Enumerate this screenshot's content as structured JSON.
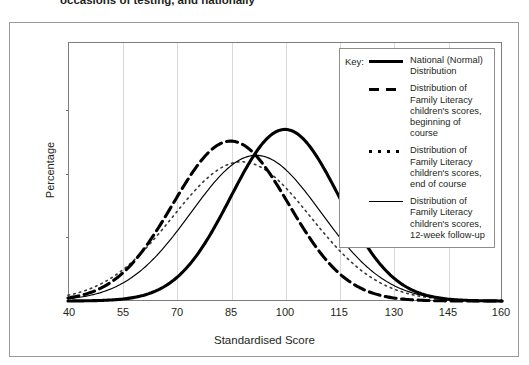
{
  "caption": "occasions of testing, and nationally",
  "chart_data": {
    "type": "line",
    "title": "",
    "xlabel": "Standardised Score",
    "ylabel": "Percentage",
    "xlim": [
      40,
      160
    ],
    "ylim": [
      0,
      4
    ],
    "xticks": [
      "40",
      "55",
      "70",
      "85",
      "100",
      "115",
      "130",
      "145",
      "160"
    ],
    "yticks": [
      "0%",
      "1%",
      "2%",
      "3%",
      "4%"
    ],
    "grid": "vertical",
    "legend_position": "top-right-inside",
    "series": [
      {
        "name": "National (Normal) Distribution",
        "style": "solid-bold",
        "mean": 100,
        "sd": 15,
        "peak_percent": 2.65,
        "points_x": [
          40,
          55,
          70,
          85,
          100,
          115,
          130,
          145,
          160
        ],
        "points_y": [
          0.0,
          0.05,
          0.3,
          1.25,
          2.65,
          1.25,
          0.3,
          0.05,
          0.0
        ]
      },
      {
        "name": "Distribution of Family Literacy children's scores, beginning of course",
        "style": "dashed",
        "mean": 85,
        "sd": 16,
        "peak_percent": 2.47,
        "points_x": [
          40,
          55,
          70,
          85,
          100,
          115,
          130,
          145,
          160
        ],
        "points_y": [
          0.08,
          0.45,
          1.45,
          2.47,
          1.45,
          0.45,
          0.08,
          0.0,
          0.0
        ]
      },
      {
        "name": "Distribution of Family Literacy children's scores, end of course",
        "style": "dotted",
        "mean": 88,
        "sd": 19,
        "peak_percent": 2.15,
        "points_x": [
          40,
          55,
          70,
          85,
          100,
          115,
          130,
          145,
          160
        ],
        "points_y": [
          0.15,
          0.55,
          1.35,
          2.1,
          1.6,
          0.65,
          0.17,
          0.02,
          0.0
        ]
      },
      {
        "name": "Distribution of Family Literacy children's scores, 12-week follow-up",
        "style": "solid-thin",
        "mean": 92,
        "sd": 18,
        "peak_percent": 2.25,
        "points_x": [
          40,
          55,
          70,
          85,
          100,
          115,
          130,
          145,
          160
        ],
        "points_y": [
          0.05,
          0.3,
          1.05,
          2.0,
          2.15,
          1.0,
          0.3,
          0.05,
          0.0
        ]
      }
    ]
  },
  "legend": {
    "key_word": "Key:",
    "entries": [
      {
        "label": "National (Normal) Distribution",
        "style": "solid-bold"
      },
      {
        "label": "Distribution of Family Literacy children's scores, beginning of course",
        "style": "dashed"
      },
      {
        "label": "Distribution of Family Literacy children's scores, end of course",
        "style": "dotted"
      },
      {
        "label": "Distribution of Family Literacy children's scores, 12-week follow-up",
        "style": "solid-thin"
      }
    ]
  }
}
